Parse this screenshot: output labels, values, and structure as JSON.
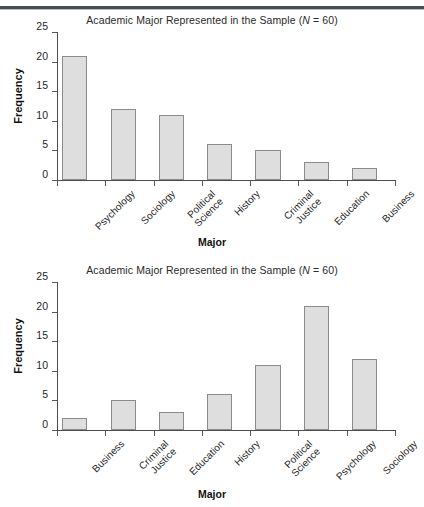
{
  "page": {
    "background": "#ffffff",
    "rule_color": "#4a4e55"
  },
  "figures": [
    {
      "id": "figure-1",
      "title_main": "Academic Major Represented in the Sample (",
      "title_italic_n": "N",
      "title_tail": " = 60)",
      "xlabel": "Major",
      "ylabel": "Frequency"
    },
    {
      "id": "figure-2",
      "title_main": "Academic Major Represented in the Sample (",
      "title_italic_n": "N",
      "title_tail": " = 60)",
      "xlabel": "Major",
      "ylabel": "Frequency"
    }
  ],
  "chart_data": [
    {
      "type": "bar",
      "title": "Academic Major Represented in the Sample (N = 60)",
      "xlabel": "Major",
      "ylabel": "Frequency",
      "categories": [
        "Psychology",
        "Sociology",
        "Political Science",
        "History",
        "Criminal Justice",
        "Education",
        "Business"
      ],
      "category_lines": [
        [
          "Psychology"
        ],
        [
          "Sociology"
        ],
        [
          "Political",
          "Science"
        ],
        [
          "History"
        ],
        [
          "Criminal",
          "Justice"
        ],
        [
          "Education"
        ],
        [
          "Business"
        ]
      ],
      "values": [
        21,
        12,
        11,
        6,
        5,
        3,
        2
      ],
      "ylim": [
        0,
        25
      ],
      "yticks": [
        0,
        5,
        10,
        15,
        20,
        25
      ],
      "grid": false,
      "legend": "none",
      "sort_order": "descending-by-frequency",
      "bar_fill": "#dedede",
      "bar_stroke": "#8b8b8b"
    },
    {
      "type": "bar",
      "title": "Academic Major Represented in the Sample (N = 60)",
      "xlabel": "Major",
      "ylabel": "Frequency",
      "categories": [
        "Business",
        "Criminal Justice",
        "Education",
        "History",
        "Political Science",
        "Psychology",
        "Sociology"
      ],
      "category_lines": [
        [
          "Business"
        ],
        [
          "Criminal",
          "Justice"
        ],
        [
          "Education"
        ],
        [
          "History"
        ],
        [
          "Political",
          "Science"
        ],
        [
          "Psychology"
        ],
        [
          "Sociology"
        ]
      ],
      "values": [
        2,
        5,
        3,
        6,
        11,
        21,
        12
      ],
      "ylim": [
        0,
        25
      ],
      "yticks": [
        0,
        5,
        10,
        15,
        20,
        25
      ],
      "grid": false,
      "legend": "none",
      "sort_order": "alphabetical",
      "bar_fill": "#dedede",
      "bar_stroke": "#8b8b8b"
    }
  ]
}
